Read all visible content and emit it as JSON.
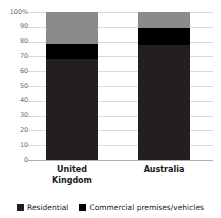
{
  "chart_data": {
    "type": "bar",
    "subtype": "stacked-percentage-column",
    "title": "",
    "xlabel": "",
    "ylabel": "",
    "categories": [
      "United Kingdom",
      "Australia"
    ],
    "category_lines": [
      [
        "United",
        "Kingdom"
      ],
      [
        "Australia"
      ]
    ],
    "series": [
      {
        "name": "Residential",
        "color": "#231f20",
        "values": [
          68.5,
          78.0
        ]
      },
      {
        "name": "Commercial premises/vehicles",
        "color": "#000000",
        "values": [
          10.0,
          11.0
        ]
      },
      {
        "name": "",
        "color": "#8a8a8a",
        "values": [
          21.5,
          11.0
        ]
      }
    ],
    "ylim": [
      0,
      100
    ],
    "yticks": [
      0,
      10,
      20,
      30,
      40,
      50,
      60,
      70,
      80,
      90,
      100
    ],
    "ytick_labels": [
      "0",
      "10",
      "20",
      "30",
      "40",
      "50",
      "60",
      "70",
      "80",
      "90",
      "100%"
    ],
    "grid": true,
    "legend_position": "bottom",
    "legend_entries": [
      {
        "label": "Residential",
        "color": "#231f20"
      },
      {
        "label": "Commercial premises/vehicles",
        "color": "#000000"
      }
    ]
  },
  "axis": {
    "y": {
      "ticks": [
        {
          "label": "100%",
          "value": 100
        },
        {
          "label": "90",
          "value": 90
        },
        {
          "label": "80",
          "value": 80
        },
        {
          "label": "70",
          "value": 70
        },
        {
          "label": "60",
          "value": 60
        },
        {
          "label": "50",
          "value": 50
        },
        {
          "label": "40",
          "value": 40
        },
        {
          "label": "30",
          "value": 30
        },
        {
          "label": "20",
          "value": 20
        },
        {
          "label": "10",
          "value": 10
        },
        {
          "label": "0",
          "value": 0
        }
      ]
    }
  },
  "colors": {
    "segment_bottom": "#231f20",
    "segment_middle": "#000000",
    "segment_top": "#8a8a8a",
    "gridline": "#d9d9d9",
    "axis_text": "#6b6b6b",
    "label_text": "#1a1a1a",
    "background": "#ffffff"
  }
}
